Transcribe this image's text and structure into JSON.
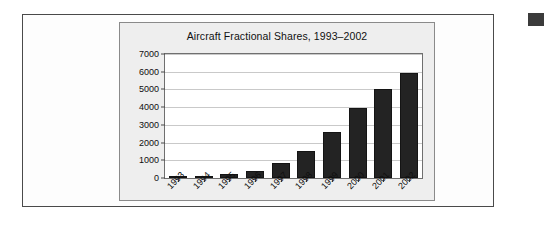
{
  "figure": {
    "border_color": "#4a4a4a",
    "panel_background": "#eeeeee"
  },
  "corner_marker": {
    "name": "selection-marker",
    "color": "#3b3b3b"
  },
  "chart_data": {
    "type": "bar",
    "title": "Aircraft Fractional Shares, 1993–2002",
    "xlabel": "",
    "ylabel": "",
    "categories": [
      "1993",
      "1994",
      "1995",
      "1996",
      "1997",
      "1998",
      "1999",
      "2000",
      "2001",
      "2002"
    ],
    "values": [
      70,
      130,
      200,
      400,
      850,
      1500,
      2600,
      3950,
      5000,
      5950
    ],
    "ylim": [
      0,
      7000
    ],
    "yticks": [
      0,
      1000,
      2000,
      3000,
      4000,
      5000,
      6000,
      7000
    ],
    "ytick_labels": [
      "0",
      "1000",
      "2000",
      "3000",
      "4000",
      "5000",
      "6000",
      "7000"
    ],
    "grid": true,
    "legend": false,
    "bar_color": "#232323",
    "plot_background": "#ffffff",
    "gridline_color": "#c9c9c9",
    "xtick_rotation": -45
  }
}
